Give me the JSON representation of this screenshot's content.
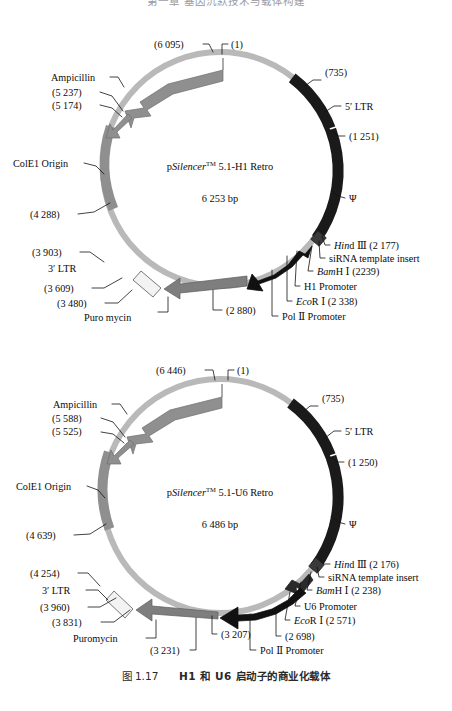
{
  "page": {
    "top_header": "第一章 基因沉默技术与载体构建",
    "caption_number": "图 1.17",
    "caption_text": "H1 和 U6 启动子的商业化载体"
  },
  "colors": {
    "backbone": "#b9b9b9",
    "gray_feature": "#8f8f8f",
    "mid_gray_feature": "#7e7e7e",
    "black_feature": "#1a1a1a",
    "white_feature": "#f2f2f2",
    "outline": "#4a4a4a",
    "text": "#0b0b0b",
    "background": "#ffffff"
  },
  "maps": [
    {
      "id": "h1",
      "center_line1_pre": "p",
      "center_line1_italic": "Silencer",
      "center_line1_sup": "TM",
      "center_line1_post": " 5.1-H1 Retro",
      "center_line2": "6 253 bp",
      "labels": {
        "origin": "(1)",
        "ampicillin_end": "(6 095)",
        "ampicillin": "Ampicillin",
        "pos_5237": "(5 237)",
        "pos_5174": "(5 174)",
        "colE1": "ColE1 Origin",
        "pos_4288": "(4 288)",
        "pos_3903": "(3 903)",
        "ltr3": "3′ LTR",
        "pos_3609": "(3 609)",
        "pos_3480": "(3 480)",
        "puromycin": "Puro mycin",
        "pos_2880": "(2 880)",
        "pol2_promoter": "Pol Ⅱ Promoter",
        "ecor1": "EcoR Ⅰ  (2 338)",
        "ecor1_italic": "Eco",
        "ecor1_rest": "R Ⅰ  (2 338)",
        "promoter": "H1 Promoter",
        "bamh1_italic": "Bam",
        "bamh1_rest": "H Ⅰ  (2239)",
        "sirna": "siRNA template insert",
        "hind3_italic": "Hin",
        "hind3_rest": "d Ⅲ  (2 177)",
        "pos_735": "(735)",
        "ltr5": "5′ LTR",
        "pos_1251": "(1 251)",
        "psi": "Ψ"
      }
    },
    {
      "id": "u6",
      "center_line1_pre": "p",
      "center_line1_italic": "Silencer",
      "center_line1_sup": "TM",
      "center_line1_post": " 5.1-U6 Retro",
      "center_line2": "6 486 bp",
      "labels": {
        "origin": "(1)",
        "ampicillin_end": "(6 446)",
        "ampicillin": "Ampicillin",
        "pos_5588": "(5 588)",
        "pos_5525": "(5 525)",
        "colE1": "ColE1 Origin",
        "pos_4639": "(4 639)",
        "pos_4254": "(4 254)",
        "ltr3": "3′ LTR",
        "pos_3960": "(3 960)",
        "pos_3831": "(3 831)",
        "puromycin": "Puromycin",
        "pos_3231": "(3 231)",
        "pos_3207": "(3 207)",
        "pol2_promoter": "Pol Ⅱ Promoter",
        "pos_2698": "(2 698)",
        "ecor1_italic": "Eco",
        "ecor1_rest": "R Ⅰ  (2 571)",
        "promoter": "U6 Promoter",
        "bamh1_italic": "Bam",
        "bamh1_rest": "H Ⅰ  (2 238)",
        "sirna": "siRNA template insert",
        "hind3_italic": "Hin",
        "hind3_rest": "d Ⅲ  (2 176)",
        "pos_735": "(735)",
        "ltr5": "5′ LTR",
        "pos_1250": "(1 250)",
        "psi": "Ψ"
      }
    }
  ]
}
